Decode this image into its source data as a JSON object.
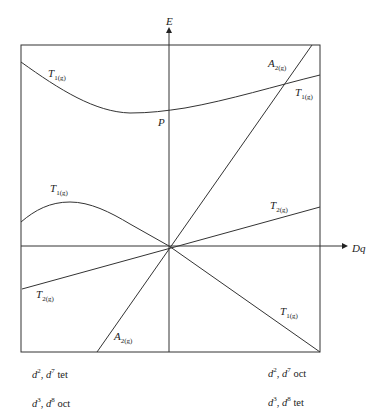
{
  "diagram": {
    "type": "Tanabe-Sugano style energy vs Dq (Orgel) diagram",
    "axes": {
      "y_label": "E",
      "x_label": "Dq"
    },
    "point_label": "P",
    "lines": [
      {
        "id": "t1g-top-curve",
        "term": "T",
        "subscript": "1(g)",
        "label_side": "left"
      },
      {
        "id": "t1g-top-right",
        "term": "T",
        "subscript": "1(g)",
        "label_side": "right"
      },
      {
        "id": "a2g-upper",
        "term": "A",
        "subscript": "2(g)",
        "label_side": "right"
      },
      {
        "id": "t1g-lower-curve",
        "term": "T",
        "subscript": "1(g)",
        "label_side": "left"
      },
      {
        "id": "t2g-right",
        "term": "T",
        "subscript": "2(g)",
        "label_side": "right"
      },
      {
        "id": "t2g-left",
        "term": "T",
        "subscript": "2(g)",
        "label_side": "left"
      },
      {
        "id": "a2g-lower",
        "term": "A",
        "subscript": "2(g)",
        "label_side": "left"
      },
      {
        "id": "t1g-lower-right",
        "term": "T",
        "subscript": "1(g)",
        "label_side": "right"
      }
    ],
    "captions": {
      "left": [
        {
          "d1": "2",
          "d2": "7",
          "geom": "tet"
        },
        {
          "d1": "3",
          "d2": "8",
          "geom": "oct"
        }
      ],
      "right": [
        {
          "d1": "2",
          "d2": "7",
          "geom": "oct"
        },
        {
          "d1": "3",
          "d2": "8",
          "geom": "tet"
        }
      ]
    }
  }
}
